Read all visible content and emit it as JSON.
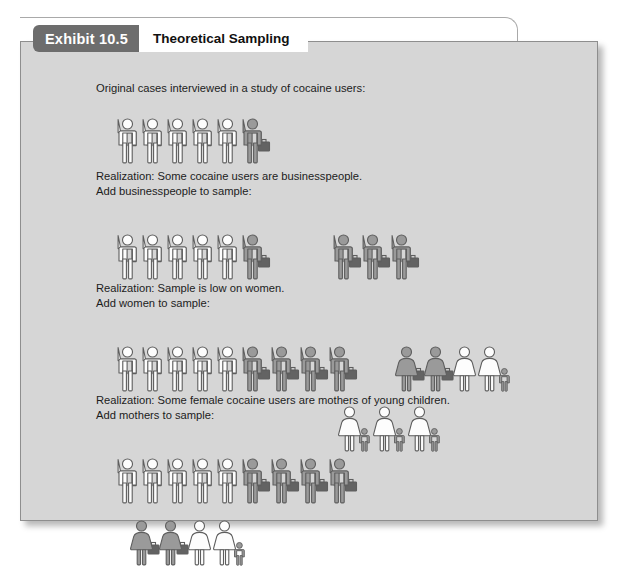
{
  "exhibit": {
    "badge": "Exhibit 10.5",
    "title": "Theoretical Sampling"
  },
  "colors": {
    "panel_bg": "#d6d6d6",
    "panel_border": "#8e8e8e",
    "badge_bg": "#6d6d6d",
    "badge_text": "#ffffff",
    "title_bg": "#ffffff",
    "title_text": "#111111",
    "figure_white_fill": "#fdfdfd",
    "figure_gray_fill": "#9a9a9a",
    "figure_outline": "#5e5e5e",
    "briefcase_fill": "#636363",
    "caption_text": "#1c1c1c"
  },
  "sections": [
    {
      "id": "original-cases",
      "caption": "Original cases interviewed in a study of cocaine users:",
      "rows": [
        {
          "id": "row-original",
          "groups": [
            {
              "id": "group-original-main",
              "figures": [
                {
                  "type": "man",
                  "fill": "white",
                  "briefcase": false
                },
                {
                  "type": "man",
                  "fill": "white",
                  "briefcase": false
                },
                {
                  "type": "man",
                  "fill": "white",
                  "briefcase": false
                },
                {
                  "type": "man",
                  "fill": "white",
                  "briefcase": false
                },
                {
                  "type": "man",
                  "fill": "white",
                  "briefcase": false
                },
                {
                  "type": "man",
                  "fill": "gray",
                  "briefcase": true
                }
              ]
            }
          ]
        }
      ]
    },
    {
      "id": "add-businesspeople",
      "caption": "Realization: Some cocaine users are businesspeople.\nAdd businesspeople to sample:",
      "rows": [
        {
          "id": "row-businesspeople",
          "groups": [
            {
              "id": "group-business-existing",
              "figures": [
                {
                  "type": "man",
                  "fill": "white",
                  "briefcase": false
                },
                {
                  "type": "man",
                  "fill": "white",
                  "briefcase": false
                },
                {
                  "type": "man",
                  "fill": "white",
                  "briefcase": false
                },
                {
                  "type": "man",
                  "fill": "white",
                  "briefcase": false
                },
                {
                  "type": "man",
                  "fill": "white",
                  "briefcase": false
                },
                {
                  "type": "man",
                  "fill": "gray",
                  "briefcase": true
                }
              ]
            },
            {
              "id": "group-business-added",
              "gap": 62,
              "figures": [
                {
                  "type": "man",
                  "fill": "gray",
                  "briefcase": true
                },
                {
                  "type": "man",
                  "fill": "gray",
                  "briefcase": true
                },
                {
                  "type": "man",
                  "fill": "gray",
                  "briefcase": true
                }
              ]
            }
          ]
        }
      ]
    },
    {
      "id": "add-women",
      "caption": "Realization: Sample is low on women.\nAdd women to sample:",
      "rows": [
        {
          "id": "row-women",
          "groups": [
            {
              "id": "group-women-existing",
              "figures": [
                {
                  "type": "man",
                  "fill": "white",
                  "briefcase": false
                },
                {
                  "type": "man",
                  "fill": "white",
                  "briefcase": false
                },
                {
                  "type": "man",
                  "fill": "white",
                  "briefcase": false
                },
                {
                  "type": "man",
                  "fill": "white",
                  "briefcase": false
                },
                {
                  "type": "man",
                  "fill": "white",
                  "briefcase": false
                },
                {
                  "type": "man",
                  "fill": "gray",
                  "briefcase": true
                },
                {
                  "type": "man",
                  "fill": "gray",
                  "briefcase": true
                },
                {
                  "type": "man",
                  "fill": "gray",
                  "briefcase": true
                },
                {
                  "type": "man",
                  "fill": "gray",
                  "briefcase": true
                }
              ]
            },
            {
              "id": "group-women-added",
              "gap": 38,
              "figures": [
                {
                  "type": "woman",
                  "fill": "gray",
                  "briefcase": true
                },
                {
                  "type": "woman",
                  "fill": "gray",
                  "briefcase": true
                },
                {
                  "type": "woman",
                  "fill": "white",
                  "briefcase": false
                },
                {
                  "type": "woman",
                  "fill": "white",
                  "briefcase": false,
                  "child": true
                }
              ]
            }
          ]
        }
      ]
    },
    {
      "id": "add-mothers",
      "caption": "Realization: Some female cocaine users are mothers of young children.\nAdd mothers to sample:",
      "rows": [
        {
          "id": "row-mothers-top",
          "groups": [
            {
              "id": "group-mothers-men",
              "figures": [
                {
                  "type": "man",
                  "fill": "white",
                  "briefcase": false
                },
                {
                  "type": "man",
                  "fill": "white",
                  "briefcase": false
                },
                {
                  "type": "man",
                  "fill": "white",
                  "briefcase": false
                },
                {
                  "type": "man",
                  "fill": "white",
                  "briefcase": false
                },
                {
                  "type": "man",
                  "fill": "white",
                  "briefcase": false
                },
                {
                  "type": "man",
                  "fill": "gray",
                  "briefcase": true
                },
                {
                  "type": "man",
                  "fill": "gray",
                  "briefcase": true
                },
                {
                  "type": "man",
                  "fill": "gray",
                  "briefcase": true
                },
                {
                  "type": "man",
                  "fill": "gray",
                  "briefcase": true
                }
              ]
            }
          ]
        },
        {
          "id": "row-mothers-bottom",
          "indent": 14,
          "groups": [
            {
              "id": "group-mothers-women",
              "figures": [
                {
                  "type": "woman",
                  "fill": "gray",
                  "briefcase": true
                },
                {
                  "type": "woman",
                  "fill": "gray",
                  "briefcase": true
                },
                {
                  "type": "woman",
                  "fill": "white",
                  "briefcase": false
                },
                {
                  "type": "woman",
                  "fill": "white",
                  "briefcase": false,
                  "child": true
                }
              ]
            }
          ]
        },
        {
          "id": "row-mothers-added",
          "offsetX": 318,
          "offsetY": -52,
          "groups": [
            {
              "id": "group-mothers-added",
              "figures": [
                {
                  "type": "woman",
                  "fill": "white",
                  "briefcase": false,
                  "child": true
                },
                {
                  "type": "woman",
                  "fill": "white",
                  "briefcase": false,
                  "child": true
                },
                {
                  "type": "woman",
                  "fill": "white",
                  "briefcase": false,
                  "child": true
                }
              ]
            }
          ]
        }
      ]
    }
  ],
  "layout": {
    "section_tops": [
      40,
      128,
      240,
      352
    ],
    "figure_row_offsets": [
      22,
      36,
      36,
      36
    ],
    "man_width": 22,
    "woman_width": 22,
    "child_width": 11
  }
}
